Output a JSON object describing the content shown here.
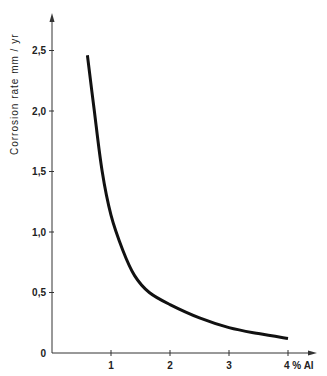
{
  "chart_data": {
    "type": "line",
    "title": "",
    "xlabel": "% Al",
    "ylabel": "Corrosion rate  mm / yr",
    "xlim": [
      0,
      4.5
    ],
    "ylim": [
      0,
      2.8
    ],
    "grid": false,
    "legend": null,
    "x_ticks": [
      1,
      2,
      3,
      4
    ],
    "x_tick_labels": [
      "1",
      "2",
      "3",
      "4 % Al"
    ],
    "y_ticks": [
      0,
      0.5,
      1.0,
      1.5,
      2.0,
      2.5
    ],
    "y_tick_labels": [
      "0",
      "0,5",
      "1,0",
      "1,5",
      "2,0",
      "2,5"
    ],
    "series": [
      {
        "name": "Corrosion rate",
        "x": [
          0.6,
          0.72,
          0.85,
          1.0,
          1.2,
          1.4,
          1.65,
          2.0,
          2.5,
          3.0,
          3.5,
          4.0
        ],
        "y": [
          2.46,
          1.99,
          1.5,
          1.14,
          0.85,
          0.64,
          0.5,
          0.4,
          0.29,
          0.21,
          0.16,
          0.12
        ]
      }
    ]
  }
}
